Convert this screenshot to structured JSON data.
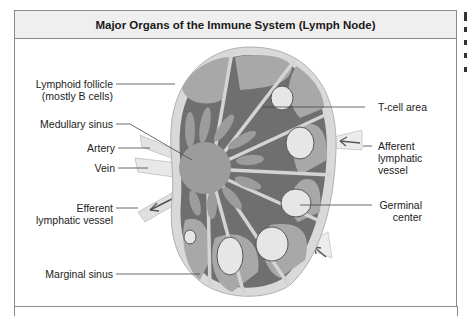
{
  "figure": {
    "title": "Major Organs of the Immune System (Lymph Node)",
    "labels_left": [
      {
        "id": "lymphoid-follicle",
        "line1": "Lymphoid follicle",
        "line2": "(mostly B cells)"
      },
      {
        "id": "medullary-sinus",
        "line1": "Medullary sinus"
      },
      {
        "id": "artery",
        "line1": "Artery"
      },
      {
        "id": "vein",
        "line1": "Vein"
      },
      {
        "id": "efferent-lymphatic-vessel",
        "line1": "Efferent",
        "line2": "lymphatic vessel"
      },
      {
        "id": "marginal-sinus",
        "line1": "Marginal sinus"
      }
    ],
    "labels_right": [
      {
        "id": "t-cell-area",
        "line1": "T-cell area"
      },
      {
        "id": "afferent-lymphatic-vessel",
        "line1": "Afferent",
        "line2": "lymphatic",
        "line3": "vessel"
      },
      {
        "id": "germinal-center",
        "line1": "Germinal",
        "line2": "center"
      }
    ],
    "colors": {
      "capsule": "#d9d9d9",
      "cortex_dark": "#6f6f6f",
      "follicle": "#a6a6a6",
      "germinal_center": "#e6e6e6",
      "medulla": "#9a9a9a",
      "trabecula": "#d4d4d4",
      "header_bg": "#efefef",
      "border": "#8a8a8a"
    }
  }
}
